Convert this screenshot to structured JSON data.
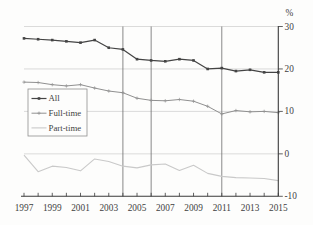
{
  "page": {
    "background": "#fdfdfc"
  },
  "chart_data": {
    "type": "line",
    "title": "",
    "xlabel": "",
    "ylabel": "",
    "unit_label": "%",
    "x": [
      1997,
      1998,
      1999,
      2000,
      2001,
      2002,
      2003,
      2004,
      2005,
      2006,
      2007,
      2008,
      2009,
      2010,
      2011,
      2012,
      2013,
      2014,
      2015
    ],
    "series": [
      {
        "name": "All",
        "color": "#444444",
        "marker": "square",
        "line_width": 1.2,
        "values": [
          27.2,
          27.0,
          26.8,
          26.5,
          26.2,
          26.8,
          25.0,
          24.6,
          22.3,
          22.0,
          21.8,
          22.3,
          22.0,
          20.0,
          20.2,
          19.5,
          19.8,
          19.2,
          19.2
        ]
      },
      {
        "name": "Full-time",
        "color": "#909090",
        "marker": "plus",
        "line_width": 1.0,
        "values": [
          16.9,
          16.8,
          16.3,
          16.0,
          16.3,
          15.5,
          14.8,
          14.4,
          13.1,
          12.6,
          12.5,
          12.8,
          12.4,
          11.2,
          9.4,
          10.2,
          9.9,
          10.0,
          9.7
        ]
      },
      {
        "name": "Part-time",
        "color": "#c9c9c9",
        "marker": "none",
        "line_width": 1.1,
        "values": [
          -0.3,
          -4.2,
          -2.9,
          -3.2,
          -4.0,
          -1.2,
          -1.8,
          -2.9,
          -3.3,
          -2.6,
          -2.4,
          -3.9,
          -2.7,
          -4.6,
          -5.3,
          -5.6,
          -5.7,
          -5.8,
          -6.3
        ]
      }
    ],
    "ylim": [
      -10,
      30
    ],
    "ytick_values": [
      30,
      20,
      10,
      0,
      -10
    ],
    "ytick_labels": [
      "30",
      "20",
      "10",
      "0",
      "-10"
    ],
    "grid_values": [
      30,
      20,
      10,
      0
    ],
    "xtick_years_minor": [
      1997,
      1998,
      1999,
      2000,
      2001,
      2002,
      2003,
      2004,
      2005,
      2006,
      2007,
      2008,
      2009,
      2010,
      2011,
      2012,
      2013,
      2014,
      2015
    ],
    "xtick_label_years": [
      1997,
      1999,
      2001,
      2003,
      2005,
      2007,
      2009,
      2011,
      2013,
      2015
    ],
    "xtick_labels": [
      "1997",
      "1999",
      "2001",
      "2003",
      "2005",
      "2007",
      "2009",
      "2011",
      "2013",
      "2015"
    ],
    "vlines": [
      2004,
      2006,
      2011
    ],
    "legend": {
      "position": "middle-left",
      "entries": [
        "All",
        "Full-time",
        "Part-time"
      ]
    },
    "grid_on": true,
    "axis_color": "#3a3a3a",
    "grid_color": "#cccccc",
    "vline_color": "#6b6b6b",
    "text_color": "#3f3f3f",
    "legend_border_color": "#8f8f8f",
    "legend_background": "#fdfdfc"
  }
}
